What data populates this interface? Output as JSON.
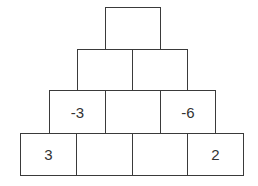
{
  "rows": [
    {
      "level": 1,
      "cells": [
        {
          "value": ""
        }
      ]
    },
    {
      "level": 2,
      "cells": [
        {
          "value": ""
        },
        {
          "value": ""
        }
      ]
    },
    {
      "level": 3,
      "cells": [
        {
          "value": "-3"
        },
        {
          "value": ""
        },
        {
          "value": "-6"
        }
      ]
    },
    {
      "level": 4,
      "cells": [
        {
          "value": "3"
        },
        {
          "value": ""
        },
        {
          "value": ""
        },
        {
          "value": "2"
        }
      ]
    }
  ],
  "colors": {
    "border": "#3a3a3a",
    "text": "#333333",
    "background": "#ffffff"
  }
}
